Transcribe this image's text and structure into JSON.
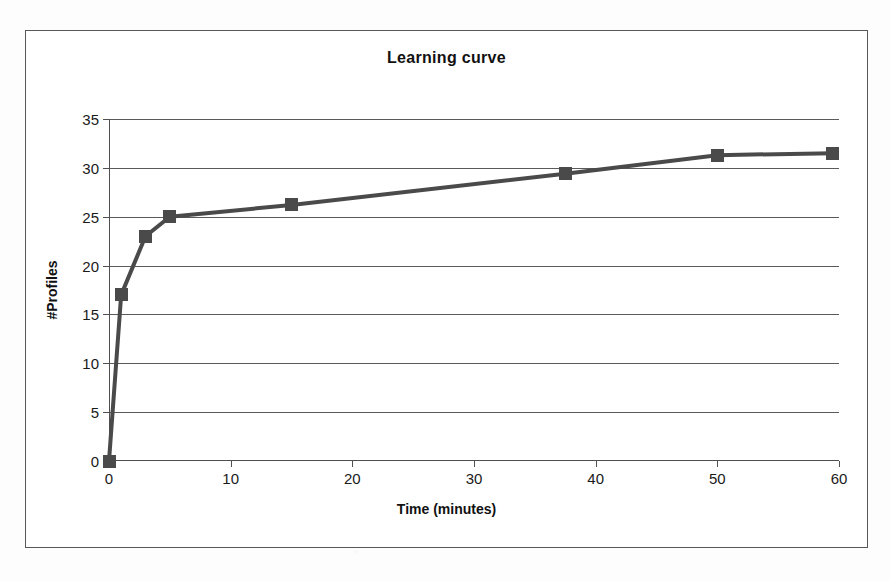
{
  "chart_data": {
    "type": "line",
    "title": "Learning curve",
    "xlabel": "Time (minutes)",
    "ylabel": "#Profiles",
    "xlim": [
      0,
      60
    ],
    "ylim": [
      0,
      35
    ],
    "xticks": [
      0,
      10,
      20,
      30,
      40,
      50,
      60
    ],
    "yticks": [
      0,
      5,
      10,
      15,
      20,
      25,
      30,
      35
    ],
    "grid": "horizontal",
    "legend": "none",
    "marker": "square",
    "series": [
      {
        "name": "Learning curve",
        "x": [
          0,
          1,
          3,
          5,
          15,
          37.5,
          50,
          59.5
        ],
        "y": [
          0,
          17,
          23,
          25,
          26.2,
          29.4,
          31.3,
          31.5
        ]
      }
    ],
    "line_color": "#4a4a4a",
    "marker_color": "#4a4a4a",
    "axis_color": "#4f4f4f",
    "grid_color": "#5a5a5a",
    "background": "#ffffff"
  }
}
